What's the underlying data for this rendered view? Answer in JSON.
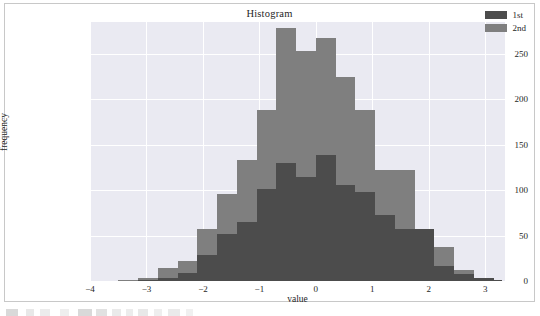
{
  "chart_data": {
    "type": "bar",
    "subtype": "histogram-overlay",
    "title": "Histogram",
    "xlabel": "value",
    "ylabel": "frequency",
    "xlim": [
      -4.0,
      3.35
    ],
    "ylim": [
      0,
      285
    ],
    "grid": true,
    "legend_position": "upper right",
    "bin_edges": [
      -3.5,
      -3.15,
      -2.8,
      -2.45,
      -2.1,
      -1.75,
      -1.4,
      -1.05,
      -0.7,
      -0.35,
      0.0,
      0.35,
      0.7,
      1.05,
      1.4,
      1.75,
      2.1,
      2.45,
      2.8,
      3.15,
      3.3
    ],
    "bin_centers": [
      -3.33,
      -2.98,
      -2.63,
      -2.28,
      -1.93,
      -1.58,
      -1.23,
      -0.88,
      -0.53,
      -0.18,
      0.18,
      0.53,
      0.88,
      1.23,
      1.58,
      1.93,
      2.28,
      2.63,
      2.98,
      3.22
    ],
    "series": [
      {
        "name": "1st",
        "color": "#4c4c4c",
        "values": [
          0,
          1,
          3,
          9,
          29,
          52,
          65,
          101,
          130,
          114,
          139,
          106,
          98,
          73,
          57,
          57,
          16,
          8,
          3,
          1
        ]
      },
      {
        "name": "2nd",
        "color": "#7f7f7f",
        "values": [
          1,
          3,
          14,
          22,
          57,
          96,
          133,
          188,
          278,
          253,
          267,
          224,
          188,
          122,
          122,
          57,
          37,
          12,
          3,
          1
        ]
      }
    ],
    "yticks": [
      0,
      50,
      100,
      150,
      200,
      250
    ],
    "ytick_labels": [
      "0",
      "50",
      "100",
      "150",
      "200",
      "250"
    ],
    "xticks": [
      -4,
      -3,
      -2,
      -1,
      0,
      1,
      2,
      3
    ],
    "xtick_labels": [
      "−4",
      "−3",
      "−2",
      "−1",
      "0",
      "1",
      "2",
      "3"
    ]
  },
  "legend": {
    "entries": [
      {
        "label": "1st",
        "color": "#4c4c4c"
      },
      {
        "label": "2nd",
        "color": "#7f7f7f"
      }
    ]
  },
  "style": {
    "plot_background": "#eaeaf2",
    "figure_background": "#ffffff",
    "grid_color": "#ffffff",
    "text_color": "#262626",
    "border_color": "#c8c8c8"
  }
}
